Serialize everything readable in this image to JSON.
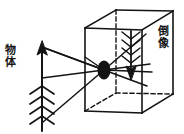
{
  "figure": {
    "width": 184,
    "height": 134,
    "background_color": "#ffffff",
    "line_color": "#141414",
    "labels": {
      "object": "物体",
      "image": "倒像"
    },
    "parts": {
      "object_arrow_name": "object-arrow",
      "image_arrow_name": "inverted-image-arrow",
      "pinhole_name": "pinhole-aperture",
      "box_name": "camera-box"
    },
    "geometry": {
      "pinhole": {
        "cx": 104,
        "cy": 70,
        "rx": 6,
        "ry": 9
      },
      "object_axis_x": 42,
      "object_top_y": 46,
      "object_bottom_y": 130,
      "image_axis_x": 131,
      "image_top_y": 31,
      "image_bottom_y": 79,
      "box_front_top_left": [
        85,
        28
      ],
      "box_front_top_right": [
        142,
        30
      ],
      "box_front_bottom_right": [
        142,
        113
      ],
      "box_front_bottom_left": [
        85,
        111
      ],
      "box_back_top_left": [
        116,
        10
      ],
      "box_back_top_right": [
        173,
        11
      ],
      "box_back_bottom_right": [
        173,
        94
      ],
      "box_back_bottom_left": [
        116,
        93
      ]
    }
  }
}
